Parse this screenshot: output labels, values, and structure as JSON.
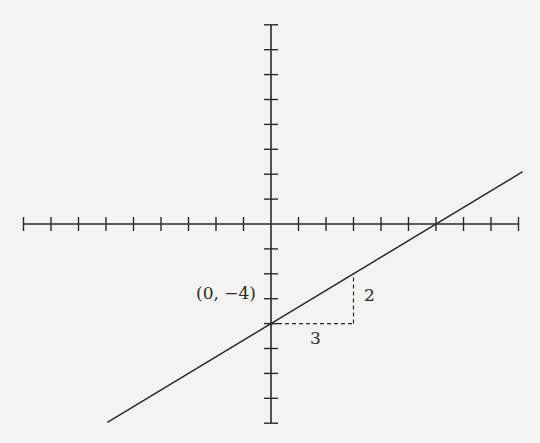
{
  "diagram": {
    "type": "line-graph",
    "line_equation": "y = (2/3)x - 4",
    "y_intercept_label": "(0, −4)",
    "rise_label": "2",
    "run_label": "3",
    "x_axis": {
      "min": -9,
      "max": 9,
      "tick_step": 1
    },
    "y_axis": {
      "min": -8,
      "max": 8,
      "tick_step": 1
    },
    "line_color": "#2a2a2a",
    "axis_color": "#2a2a2a",
    "background": "#f3f3f1"
  }
}
